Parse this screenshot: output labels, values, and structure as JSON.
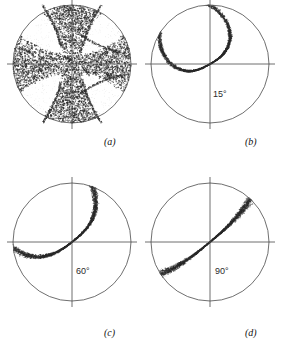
{
  "figure": {
    "title": "",
    "background_color": "#ffffff",
    "line_color": "#4a4a4a",
    "stipple_color": "#2b2b2b"
  },
  "chart_data": {
    "type": "scatter",
    "title": "",
    "xlabel": "",
    "ylabel": "",
    "projection": "stereographic pole figure",
    "grid": false,
    "legend": null,
    "panels": [
      {
        "caption": "(a)",
        "angle_label": "",
        "pattern": "cross",
        "description": "Dense stippled plus/cross shaped distribution occupying the horizontal and vertical bands of the disc, with four light lobes in the diagonal quadrants",
        "density": "high",
        "cx": 71.5,
        "cy": 64.0,
        "r": 59.0,
        "caption_x": 104,
        "caption_y": 136
      },
      {
        "caption": "(b)",
        "angle_label": "15°",
        "pattern": "s-band",
        "description": "Narrow S-shaped stippled band running from lower-left through the centre to the right edge, strongly curved",
        "density": "medium",
        "curvature": 0.85,
        "band_angle_deg": 30,
        "cx": 210.0,
        "cy": 64.0,
        "r": 59.0,
        "label_x": 213,
        "label_y": 89,
        "caption_x": 245,
        "caption_y": 136
      },
      {
        "caption": "(c)",
        "angle_label": "60°",
        "pattern": "s-band",
        "description": "Stippled band from lower-left to upper-right through the centre, moderately curved",
        "density": "medium",
        "curvature": 0.45,
        "band_angle_deg": 38,
        "cx": 71.5,
        "cy": 242.0,
        "r": 59.0,
        "label_x": 76,
        "label_y": 266,
        "caption_x": 104,
        "caption_y": 327
      },
      {
        "caption": "(d)",
        "angle_label": "90°",
        "pattern": "s-band",
        "description": "Nearly straight stippled diagonal band from lower-left to upper-right through the centre",
        "density": "medium",
        "curvature": 0.1,
        "band_angle_deg": 40,
        "cx": 210.0,
        "cy": 242.0,
        "r": 59.0,
        "label_x": 215,
        "label_y": 266,
        "caption_x": 245,
        "caption_y": 327
      }
    ]
  }
}
